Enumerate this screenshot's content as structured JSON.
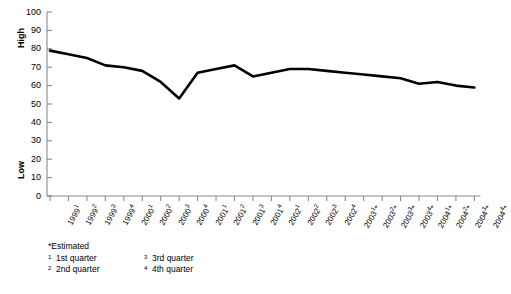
{
  "axis_titles": {
    "high": "High",
    "low": "Low"
  },
  "footnotes": {
    "estimated": "*Estimated",
    "items": [
      {
        "marker": "1",
        "text": "1st quarter"
      },
      {
        "marker": "3",
        "text": "3rd quarter"
      },
      {
        "marker": "2",
        "text": "2nd quarter"
      },
      {
        "marker": "4",
        "text": "4th quarter"
      }
    ]
  },
  "colors": {
    "line": "#000000",
    "axis": "#8a8a8a",
    "text": "#000000",
    "background": "#ffffff"
  },
  "chart_data": {
    "type": "line",
    "title": "",
    "subtitle": "",
    "xlabel": "",
    "ylabel": "High / Low",
    "ylim": [
      0,
      100
    ],
    "ytick_step": 10,
    "yticks": [
      100,
      90,
      80,
      70,
      60,
      50,
      40,
      30,
      20,
      10,
      0
    ],
    "grid": false,
    "legend": null,
    "annotations": [
      "*Estimated",
      "1 1st quarter",
      "2 2nd quarter",
      "3 3rd quarter",
      "4 4th quarter"
    ],
    "categories": [
      "1999¹",
      "1999²",
      "1999³",
      "1999⁴",
      "2000¹",
      "2000²",
      "2000³",
      "2000⁴",
      "2001¹",
      "2001²",
      "2001³",
      "2001⁴",
      "2002¹",
      "2002²",
      "2002³",
      "2002⁴",
      "2003¹*",
      "2003²*",
      "2003³*",
      "2003⁴*",
      "2004¹*",
      "2004²*",
      "2004³*",
      "2004⁴*"
    ],
    "xtick_labels": [
      {
        "year": "1999",
        "marker": "1",
        "estimated": false
      },
      {
        "year": "1999",
        "marker": "2",
        "estimated": false
      },
      {
        "year": "1999",
        "marker": "3",
        "estimated": false
      },
      {
        "year": "1999",
        "marker": "4",
        "estimated": false
      },
      {
        "year": "2000",
        "marker": "1",
        "estimated": false
      },
      {
        "year": "2000",
        "marker": "2",
        "estimated": false
      },
      {
        "year": "2000",
        "marker": "3",
        "estimated": false
      },
      {
        "year": "2000",
        "marker": "4",
        "estimated": false
      },
      {
        "year": "2001",
        "marker": "1",
        "estimated": false
      },
      {
        "year": "2001",
        "marker": "2",
        "estimated": false
      },
      {
        "year": "2001",
        "marker": "3",
        "estimated": false
      },
      {
        "year": "2001",
        "marker": "4",
        "estimated": false
      },
      {
        "year": "2002",
        "marker": "1",
        "estimated": false
      },
      {
        "year": "2002",
        "marker": "2",
        "estimated": false
      },
      {
        "year": "2002",
        "marker": "3",
        "estimated": false
      },
      {
        "year": "2002",
        "marker": "4",
        "estimated": false
      },
      {
        "year": "2003",
        "marker": "1",
        "estimated": true
      },
      {
        "year": "2003",
        "marker": "2",
        "estimated": true
      },
      {
        "year": "2003",
        "marker": "3",
        "estimated": true
      },
      {
        "year": "2003",
        "marker": "4",
        "estimated": true
      },
      {
        "year": "2004",
        "marker": "1",
        "estimated": true
      },
      {
        "year": "2004",
        "marker": "2",
        "estimated": true
      },
      {
        "year": "2004",
        "marker": "3",
        "estimated": true
      },
      {
        "year": "2004",
        "marker": "4",
        "estimated": true
      }
    ],
    "values": [
      79,
      77,
      75,
      71,
      70,
      68,
      62,
      53,
      67,
      69,
      71,
      65,
      67,
      69,
      69,
      68,
      67,
      66,
      65,
      64,
      61,
      62,
      60,
      59
    ]
  }
}
